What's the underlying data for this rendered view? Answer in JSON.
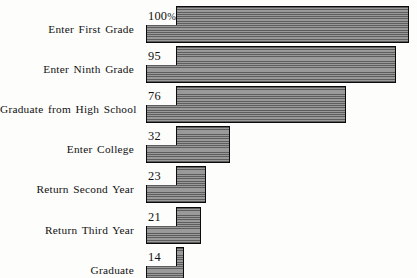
{
  "chart_data": {
    "type": "bar",
    "orientation": "horizontal",
    "title": "",
    "subtitle": "",
    "xlabel": "",
    "ylabel": "",
    "grid": false,
    "legend": null,
    "axis_max": 100,
    "unit": "percent",
    "categories": [
      "Enter First Grade",
      "Enter Ninth Grade",
      "Graduate from High School",
      "Enter College",
      "Return Second Year",
      "Return Third Year",
      "Graduate"
    ],
    "values": [
      100,
      95,
      76,
      32,
      23,
      21,
      14
    ],
    "value_labels": [
      "100%",
      "95",
      "76",
      "32",
      "23",
      "21",
      "14"
    ],
    "colors": {
      "bar_fill": "#7e7e7e",
      "bar_hatch_dark": "#5d5d5d",
      "bar_hatch_light": "#9a9a9a",
      "bar_outline": "#0b0b0b",
      "background": "#fdfdfc",
      "text": "#111111"
    }
  },
  "rows": [
    {
      "label": "Enter First Grade",
      "value_label": "100",
      "suffix": "%",
      "value": 100
    },
    {
      "label": "Enter Ninth Grade",
      "value_label": "95",
      "suffix": "",
      "value": 95
    },
    {
      "label": "Graduate from High School",
      "value_label": "76",
      "suffix": "",
      "value": 76
    },
    {
      "label": "Enter College",
      "value_label": "32",
      "suffix": "",
      "value": 32
    },
    {
      "label": "Return Second Year",
      "value_label": "23",
      "suffix": "",
      "value": 23
    },
    {
      "label": "Return Third Year",
      "value_label": "21",
      "suffix": "",
      "value": 21
    },
    {
      "label": "Graduate",
      "value_label": "14",
      "suffix": "",
      "value": 14
    }
  ]
}
